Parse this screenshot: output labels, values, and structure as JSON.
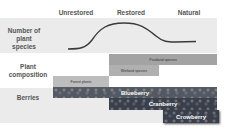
{
  "columns": [
    {
      "label": "Unrestored"
    },
    {
      "label": "Restored"
    },
    {
      "label": "Natural"
    }
  ],
  "rows": {
    "species": {
      "label": "Number of plant species"
    },
    "composition": {
      "label": "Plant composition"
    },
    "berries": {
      "label": "Berries"
    }
  },
  "composition_bars": [
    {
      "label": "Peatland species",
      "color": "#a3a3a3"
    },
    {
      "label": "Wetland species",
      "color": "#b0b0b0"
    },
    {
      "label": "Forest plants",
      "color": "#bdbdbd"
    }
  ],
  "berry_bars": [
    {
      "label": "Blueberry"
    },
    {
      "label": "Cranberry"
    },
    {
      "label": "Crowberry"
    }
  ],
  "colors": {
    "band": "#ebebeb",
    "curve": "#3a3a3a"
  }
}
